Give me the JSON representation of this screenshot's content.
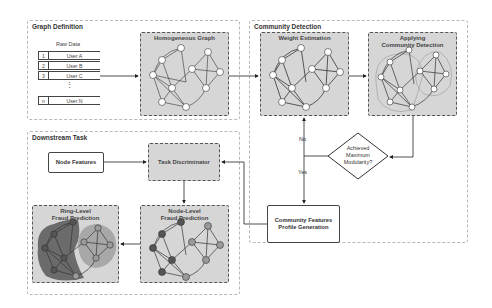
{
  "panels": {
    "graph_definition": {
      "title": "Graph Definition",
      "raw_data": {
        "label": "Raw Data",
        "rows": [
          {
            "index": "1",
            "value": "User A"
          },
          {
            "index": "2",
            "value": "User B"
          },
          {
            "index": "3",
            "value": "User C"
          },
          {
            "index": "n",
            "value": "User N"
          }
        ],
        "ellipsis": "⋮"
      },
      "homogeneous_graph": {
        "title": "Homogeneous Graph"
      }
    },
    "community_detection": {
      "title": "Community Detection",
      "weight_estimation": {
        "title": "Weight Estimation"
      },
      "applying_community_detection": {
        "title_line1": "Applying",
        "title_line2": "Community Detection"
      },
      "decision": {
        "line1": "Achieved",
        "line2": "Maximum",
        "line3": "Modularity?"
      },
      "no_label": "No",
      "yes_label": "Yes",
      "community_features": {
        "line1": "Community Features",
        "line2": "Profile Generation"
      }
    },
    "downstream_task": {
      "title": "Downstream Task",
      "node_features": "Node Features",
      "task_discriminator": "Task Discriminator",
      "node_level": {
        "line1": "Node-Level",
        "line2": "Fraud Prediction"
      },
      "ring_level": {
        "line1": "Ring-Level",
        "line2": "Fraud Prediction"
      }
    }
  },
  "graph": {
    "node_labels": [
      "A",
      "B",
      "C",
      "D",
      "E",
      "F",
      "G",
      "H",
      "I",
      "J",
      "K"
    ],
    "colors": {
      "box_fill": "#d6d6d6",
      "node_fill": "#ffffff",
      "fraud_node_fill": "#555555",
      "normal_node_fill": "#9a9a9a",
      "ring_dark": "#6b6b6b",
      "ring_light": "#a8a8a8",
      "edge": "#333333"
    }
  }
}
